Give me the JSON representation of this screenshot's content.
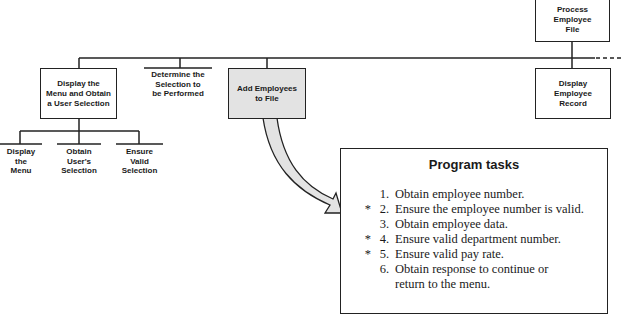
{
  "diagram": {
    "nodes": {
      "process_employee_file": "Process\nEmployee\nFile",
      "display_menu": "Display the\nMenu and Obtain\na User Selection",
      "determine_selection": "Determine the\nSelection to\nbe Performed",
      "add_employees": "Add Employees\nto File",
      "display_employee_record": "Display\nEmployee\nRecord",
      "display_the_menu": "Display\nthe\nMenu",
      "obtain_selection": "Obtain\nUser's\nSelection",
      "ensure_valid_selection": "Ensure\nValid\nSelection"
    },
    "colors": {
      "line": "#222222",
      "shaded_box": "#e3e3e3",
      "arrow_fill": "#e3e3e3"
    }
  },
  "tasks_panel": {
    "title": "Program tasks",
    "items": [
      {
        "star": "",
        "num": "1.",
        "text": "Obtain employee number."
      },
      {
        "star": "*",
        "num": "2.",
        "text": "Ensure the employee number is valid."
      },
      {
        "star": "",
        "num": "3.",
        "text": "Obtain employee data."
      },
      {
        "star": "*",
        "num": "4.",
        "text": "Ensure valid department number."
      },
      {
        "star": "*",
        "num": "5.",
        "text": "Ensure valid pay rate."
      },
      {
        "star": "",
        "num": "6.",
        "text": "Obtain response to continue or"
      },
      {
        "star": "",
        "num": "",
        "text": "return to the menu."
      }
    ]
  }
}
